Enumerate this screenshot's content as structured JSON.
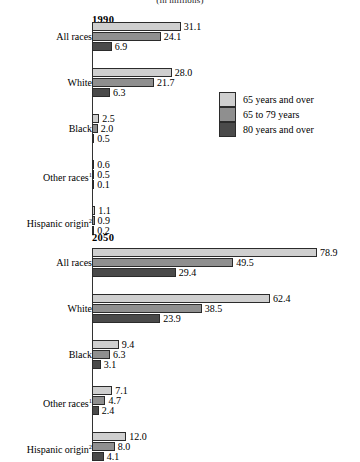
{
  "chart_data": {
    "type": "bar",
    "title": "(in millions)",
    "orientation": "horizontal",
    "xlabel": "",
    "ylabel": "",
    "xlim": [
      0,
      80
    ],
    "grid": false,
    "legend_position": "middle-right",
    "legend": [
      {
        "label": "65 years and over",
        "color": "#cfcfcf"
      },
      {
        "label": "65 to 79 years",
        "color": "#8f8f8f"
      },
      {
        "label": "80 years and over",
        "color": "#4a4a4a"
      }
    ],
    "series": [
      {
        "name": "65 years and over",
        "color": "#cfcfcf"
      },
      {
        "name": "65 to 79 years",
        "color": "#8f8f8f"
      },
      {
        "name": "80 years and over",
        "color": "#4a4a4a"
      }
    ],
    "categories": [
      "All races",
      "White",
      "Black",
      "Other races",
      "Hispanic origin"
    ],
    "panels": [
      {
        "year": "1990",
        "groups": [
          {
            "label": "All races",
            "footnote": "",
            "values": [
              31.1,
              24.1,
              6.9
            ],
            "labels": [
              "31.1",
              "24.1",
              "6.9"
            ]
          },
          {
            "label": "White",
            "footnote": "",
            "values": [
              28.0,
              21.7,
              6.3
            ],
            "labels": [
              "28.0",
              "21.7",
              "6.3"
            ]
          },
          {
            "label": "Black",
            "footnote": "",
            "values": [
              2.5,
              2.0,
              0.5
            ],
            "labels": [
              "2.5",
              "2.0",
              "0.5"
            ]
          },
          {
            "label": "Other races",
            "footnote": "1",
            "values": [
              0.6,
              0.5,
              0.1
            ],
            "labels": [
              "0.6",
              "0.5",
              "0.1"
            ]
          },
          {
            "label": "Hispanic origin",
            "footnote": "2",
            "values": [
              1.1,
              0.9,
              0.2
            ],
            "labels": [
              "1.1",
              "0.9",
              "0.2"
            ]
          }
        ]
      },
      {
        "year": "2050",
        "groups": [
          {
            "label": "All races",
            "footnote": "",
            "values": [
              78.9,
              49.5,
              29.4
            ],
            "labels": [
              "78.9",
              "49.5",
              "29.4"
            ]
          },
          {
            "label": "White",
            "footnote": "",
            "values": [
              62.4,
              38.5,
              23.9
            ],
            "labels": [
              "62.4",
              "38.5",
              "23.9"
            ]
          },
          {
            "label": "Black",
            "footnote": "",
            "values": [
              9.4,
              6.3,
              3.1
            ],
            "labels": [
              "9.4",
              "6.3",
              "3.1"
            ]
          },
          {
            "label": "Other races",
            "footnote": "1",
            "values": [
              7.1,
              4.7,
              2.4
            ],
            "labels": [
              "7.1",
              "4.7",
              "2.4"
            ]
          },
          {
            "label": "Hispanic origin",
            "footnote": "2",
            "values": [
              12.0,
              8.0,
              4.1
            ],
            "labels": [
              "12.0",
              "8.0",
              "4.1"
            ]
          }
        ]
      }
    ]
  }
}
